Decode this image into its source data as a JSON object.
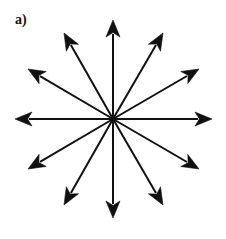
{
  "figure": {
    "panel_label": "a)",
    "width": 226,
    "height": 239,
    "background_color": "#ffffff",
    "stroke_color": "#111111"
  },
  "chart_data": {
    "type": "scatter",
    "title": "a)",
    "subtitle": "",
    "xlabel": "",
    "ylabel": "",
    "grid": false,
    "legend": null,
    "axis_visible": false,
    "center": {
      "x": 113,
      "y": 119
    },
    "arrow_count": 12,
    "arrow_length": 99,
    "angular_step_deg": 30,
    "line_width": 2,
    "arrowhead_length": 17,
    "arrowhead_half_width": 7,
    "arrows": [
      {
        "name": "arrow-0deg",
        "angle_deg": 0,
        "tip_x": 212,
        "tip_y": 119,
        "label": "0°"
      },
      {
        "name": "arrow-30deg",
        "angle_deg": 30,
        "tip_x": 199,
        "tip_y": 69,
        "label": "30°"
      },
      {
        "name": "arrow-60deg",
        "angle_deg": 60,
        "tip_x": 163,
        "tip_y": 33,
        "label": "60°"
      },
      {
        "name": "arrow-90deg",
        "angle_deg": 90,
        "tip_x": 113,
        "tip_y": 20,
        "label": "90°"
      },
      {
        "name": "arrow-120deg",
        "angle_deg": 120,
        "tip_x": 64,
        "tip_y": 33,
        "label": "120°"
      },
      {
        "name": "arrow-150deg",
        "angle_deg": 150,
        "tip_x": 28,
        "tip_y": 69,
        "label": "150°"
      },
      {
        "name": "arrow-180deg",
        "angle_deg": 180,
        "tip_x": 15,
        "tip_y": 119,
        "label": "180°"
      },
      {
        "name": "arrow-210deg",
        "angle_deg": 210,
        "tip_x": 28,
        "tip_y": 169,
        "label": "210°"
      },
      {
        "name": "arrow-240deg",
        "angle_deg": 240,
        "tip_x": 64,
        "tip_y": 205,
        "label": "240°"
      },
      {
        "name": "arrow-270deg",
        "angle_deg": 270,
        "tip_x": 113,
        "tip_y": 218,
        "label": "270°"
      },
      {
        "name": "arrow-300deg",
        "angle_deg": 300,
        "tip_x": 163,
        "tip_y": 205,
        "label": "300°"
      },
      {
        "name": "arrow-330deg",
        "angle_deg": 330,
        "tip_x": 199,
        "tip_y": 169,
        "label": "330°"
      }
    ]
  }
}
